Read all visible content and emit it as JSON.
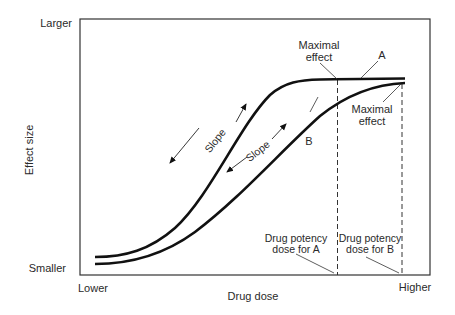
{
  "diagram": {
    "type": "dose-response curves",
    "y_axis": {
      "label": "Effect size",
      "top": "Larger",
      "bottom": "Smaller"
    },
    "x_axis": {
      "label": "Drug dose",
      "left": "Lower",
      "right": "Higher"
    },
    "curves": [
      {
        "name": "A",
        "label": "A"
      },
      {
        "name": "B",
        "label": "B"
      }
    ],
    "annotations": {
      "maximal_effect_a_line1": "Maximal",
      "maximal_effect_a_line2": "effect",
      "maximal_effect_b_line1": "Maximal",
      "maximal_effect_b_line2": "effect",
      "slope_a": "Slope",
      "slope_b": "Slope",
      "potency_a_line1": "Drug potency",
      "potency_a_line2": "dose for A",
      "potency_b_line1": "Drug potency",
      "potency_b_line2": "dose for B"
    }
  }
}
